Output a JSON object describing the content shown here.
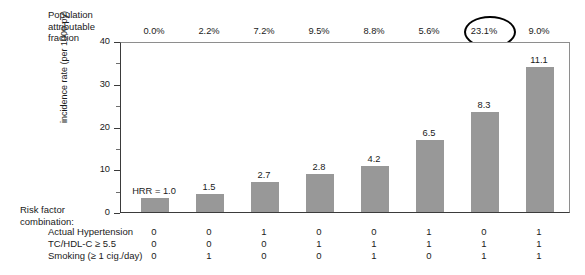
{
  "chart_data": {
    "type": "bar",
    "title": "",
    "xlabel": "",
    "ylabel": "incidence rate (per 1000 py)",
    "ylim": [
      0,
      40
    ],
    "yticks": [
      0,
      10,
      20,
      30,
      40
    ],
    "ytick_labels": [
      "0",
      "10",
      "20",
      "30",
      "40"
    ],
    "minor_ytick_step": 5,
    "grid": false,
    "legend": null,
    "bar_color": "#989898",
    "categories": [
      "1",
      "2",
      "3",
      "4",
      "5",
      "6",
      "7",
      "8"
    ],
    "values": [
      3.2,
      4.2,
      7.0,
      8.9,
      10.8,
      16.9,
      23.3,
      34.0
    ],
    "bar_value_labels": [
      "HRR = 1.0",
      "1.5",
      "2.7",
      "2.8",
      "4.2",
      "6.5",
      "8.3",
      "11.1"
    ],
    "hazard_rate_ratios": [
      1.0,
      1.5,
      2.7,
      2.8,
      4.2,
      6.5,
      8.3,
      11.1
    ],
    "population_attributable_fraction": [
      "0.0%",
      "2.2%",
      "7.2%",
      "9.5%",
      "8.8%",
      "5.6%",
      "23.1%",
      "9.0%"
    ],
    "highlighted_paf_index": 6,
    "annotations": [
      {
        "name": "circle-highlight",
        "target": "23.1%",
        "shape": "ellipse",
        "color": "#000000"
      }
    ]
  },
  "paf_header": {
    "line1": "Population",
    "line2": "attributable",
    "line3": "fraction"
  },
  "risk_table": {
    "caption_line1": "Risk factor",
    "caption_line2": "combination:",
    "rows": [
      {
        "label": "Actual Hypertension",
        "values": [
          "0",
          "0",
          "1",
          "0",
          "0",
          "1",
          "1",
          "0",
          "1"
        ]
      },
      {
        "label": "TC/HDL-C ≥ 5.5",
        "values": [
          "0",
          "0",
          "0",
          "1",
          "1",
          "1",
          "0",
          "1",
          "1"
        ]
      },
      {
        "label": "Smoking (≥ 1 cig./day)",
        "values": [
          "0",
          "1",
          "0",
          "0",
          "1",
          "0",
          "1",
          "1",
          "1"
        ]
      }
    ],
    "rows_by_column": [
      {
        "hypertension": "0",
        "tc_hdl": "0",
        "smoking": "0"
      },
      {
        "hypertension": "0",
        "tc_hdl": "0",
        "smoking": "1"
      },
      {
        "hypertension": "1",
        "tc_hdl": "0",
        "smoking": "0"
      },
      {
        "hypertension": "0",
        "tc_hdl": "1",
        "smoking": "0"
      },
      {
        "hypertension": "0",
        "tc_hdl": "1",
        "smoking": "1"
      },
      {
        "hypertension": "1",
        "tc_hdl": "1",
        "smoking": "0"
      },
      {
        "hypertension": "1",
        "tc_hdl": "0",
        "smoking": "1"
      },
      {
        "hypertension": "0",
        "tc_hdl": "1",
        "smoking": "1"
      },
      {
        "hypertension": "1",
        "tc_hdl": "1",
        "smoking": "1"
      }
    ]
  },
  "table_columns": [
    {
      "hypertension": "0",
      "tc_hdl": "0",
      "smoking": "0"
    },
    {
      "hypertension": "0",
      "tc_hdl": "0",
      "smoking": "1"
    },
    {
      "hypertension": "1",
      "tc_hdl": "0",
      "smoking": "0"
    },
    {
      "hypertension": "0",
      "tc_hdl": "1",
      "smoking": "0"
    },
    {
      "hypertension": "0",
      "tc_hdl": "1",
      "smoking": "1"
    },
    {
      "hypertension": "1",
      "tc_hdl": "1",
      "smoking": "0"
    },
    {
      "hypertension": "0",
      "tc_hdl": "1",
      "smoking": "1"
    },
    {
      "hypertension": "1",
      "tc_hdl": "1",
      "smoking": "1"
    }
  ],
  "axis": {
    "y_title": "incidence rate (per 1000 py)"
  }
}
